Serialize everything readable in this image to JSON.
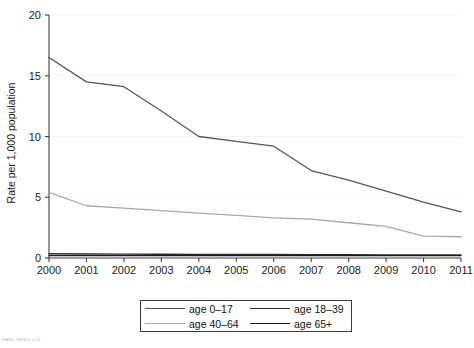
{
  "chart_data": {
    "type": "line",
    "title": "",
    "xlabel": "",
    "ylabel": "Rate per 1,000 population",
    "x": [
      2000,
      2001,
      2002,
      2003,
      2004,
      2005,
      2006,
      2007,
      2008,
      2009,
      2010,
      2011
    ],
    "categories": [
      "2000",
      "2001",
      "2002",
      "2003",
      "2004",
      "2005",
      "2006",
      "2007",
      "2008",
      "2009",
      "2010",
      "2011"
    ],
    "xlim": [
      2000,
      2011
    ],
    "ylim": [
      0,
      20
    ],
    "yticks": [
      0,
      5,
      10,
      15,
      20
    ],
    "ytick_labels": [
      "0",
      "5",
      "10",
      "15",
      "20"
    ],
    "grid": "horizontal-faint",
    "legend_position": "bottom-center",
    "series": [
      {
        "name": "age 0–17",
        "color": "#555555",
        "values": [
          16.5,
          14.5,
          14.1,
          12.1,
          10.0,
          9.6,
          9.2,
          7.2,
          6.4,
          5.5,
          4.6,
          3.8
        ]
      },
      {
        "name": "age 18–39",
        "color": "#2b2b2b",
        "values": [
          0.35,
          0.33,
          0.32,
          0.31,
          0.3,
          0.3,
          0.29,
          0.28,
          0.27,
          0.26,
          0.25,
          0.25
        ]
      },
      {
        "name": "age 40–64",
        "color": "#a8a8a8",
        "values": [
          5.4,
          4.3,
          4.1,
          3.9,
          3.7,
          3.5,
          3.3,
          3.2,
          2.9,
          2.6,
          1.8,
          1.75
        ]
      },
      {
        "name": "age 65+",
        "color": "#1a1a1a",
        "values": [
          0.2,
          0.2,
          0.2,
          0.2,
          0.2,
          0.2,
          0.2,
          0.2,
          0.2,
          0.2,
          0.2,
          0.2
        ]
      }
    ]
  },
  "legend": {
    "entries": [
      {
        "label": "age 0–17",
        "color": "#555555"
      },
      {
        "label": "age 18–39",
        "color": "#2b2b2b"
      },
      {
        "label": "age 40–64",
        "color": "#a8a8a8"
      },
      {
        "label": "age 65+",
        "color": "#1a1a1a"
      }
    ]
  },
  "credit": {
    "text": "RAND RR301-4.26"
  },
  "axes": {
    "y_label": "Rate per 1,000 population"
  }
}
